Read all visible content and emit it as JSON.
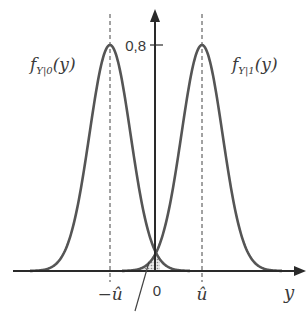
{
  "diagram": {
    "type": "probability-density-plot",
    "curves": [
      {
        "name": "f_{Y|0}(y)",
        "label_main": "f",
        "label_sub": "Y|0",
        "label_arg": "(y)",
        "center": "-û",
        "peak": 0.8
      },
      {
        "name": "f_{Y|1}(y)",
        "label_main": "f",
        "label_sub": "Y|1",
        "label_arg": "(y)",
        "center": "û",
        "peak": 0.8
      }
    ],
    "y_axis": {
      "tick_label": "0,8"
    },
    "x_axis": {
      "label": "y",
      "ticks": [
        {
          "label": "−û"
        },
        {
          "label": "0"
        },
        {
          "label": "û"
        }
      ]
    },
    "shaded_region": "overlap area near origin (error probability)",
    "colors": {
      "curve": "#555555",
      "axis": "#2a2a2a",
      "text": "#3a3a3a",
      "shade": "#bdbdbd"
    }
  }
}
